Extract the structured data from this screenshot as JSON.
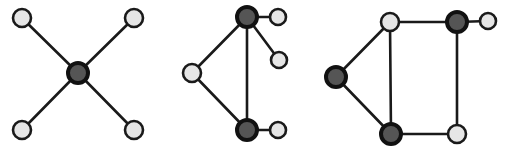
{
  "diagram": {
    "title": "",
    "colors": {
      "edge": "#1a1a1a",
      "light_fill": "#e6e6e6",
      "dark_fill": "#555555",
      "outline": "#111111"
    },
    "graphs": [
      {
        "name": "star-graph",
        "nodes": [
          {
            "id": "a",
            "x": 22,
            "y": 18,
            "r": 9,
            "type": "light"
          },
          {
            "id": "b",
            "x": 134,
            "y": 18,
            "r": 9,
            "type": "light"
          },
          {
            "id": "c",
            "x": 78,
            "y": 73,
            "r": 10,
            "type": "dark"
          },
          {
            "id": "d",
            "x": 22,
            "y": 130,
            "r": 9,
            "type": "light"
          },
          {
            "id": "e",
            "x": 134,
            "y": 130,
            "r": 9,
            "type": "light"
          }
        ],
        "edges": [
          [
            "a",
            "c"
          ],
          [
            "b",
            "c"
          ],
          [
            "d",
            "c"
          ],
          [
            "e",
            "c"
          ]
        ]
      },
      {
        "name": "two-hub-graph",
        "nodes": [
          {
            "id": "t",
            "x": 247,
            "y": 17,
            "r": 10,
            "type": "dark"
          },
          {
            "id": "tr",
            "x": 278,
            "y": 17,
            "r": 8,
            "type": "light"
          },
          {
            "id": "mr",
            "x": 279,
            "y": 60,
            "r": 8,
            "type": "light"
          },
          {
            "id": "l",
            "x": 192,
            "y": 73,
            "r": 9,
            "type": "light"
          },
          {
            "id": "b",
            "x": 247,
            "y": 130,
            "r": 10,
            "type": "dark"
          },
          {
            "id": "br",
            "x": 278,
            "y": 130,
            "r": 8,
            "type": "light"
          }
        ],
        "edges": [
          [
            "t",
            "tr"
          ],
          [
            "t",
            "mr"
          ],
          [
            "t",
            "l"
          ],
          [
            "t",
            "b"
          ],
          [
            "l",
            "b"
          ],
          [
            "b",
            "br"
          ]
        ]
      },
      {
        "name": "cycle-graph",
        "nodes": [
          {
            "id": "tl",
            "x": 390,
            "y": 22,
            "r": 9,
            "type": "light"
          },
          {
            "id": "tm",
            "x": 457,
            "y": 22,
            "r": 10,
            "type": "dark"
          },
          {
            "id": "tr",
            "x": 488,
            "y": 21,
            "r": 8,
            "type": "light"
          },
          {
            "id": "l",
            "x": 336,
            "y": 77,
            "r": 10,
            "type": "dark"
          },
          {
            "id": "bl",
            "x": 391,
            "y": 134,
            "r": 10,
            "type": "dark"
          },
          {
            "id": "br",
            "x": 457,
            "y": 134,
            "r": 9,
            "type": "light"
          }
        ],
        "edges": [
          [
            "tl",
            "tm"
          ],
          [
            "tm",
            "tr"
          ],
          [
            "tl",
            "l"
          ],
          [
            "tl",
            "bl"
          ],
          [
            "l",
            "bl"
          ],
          [
            "bl",
            "br"
          ],
          [
            "tm",
            "br"
          ]
        ]
      }
    ]
  }
}
